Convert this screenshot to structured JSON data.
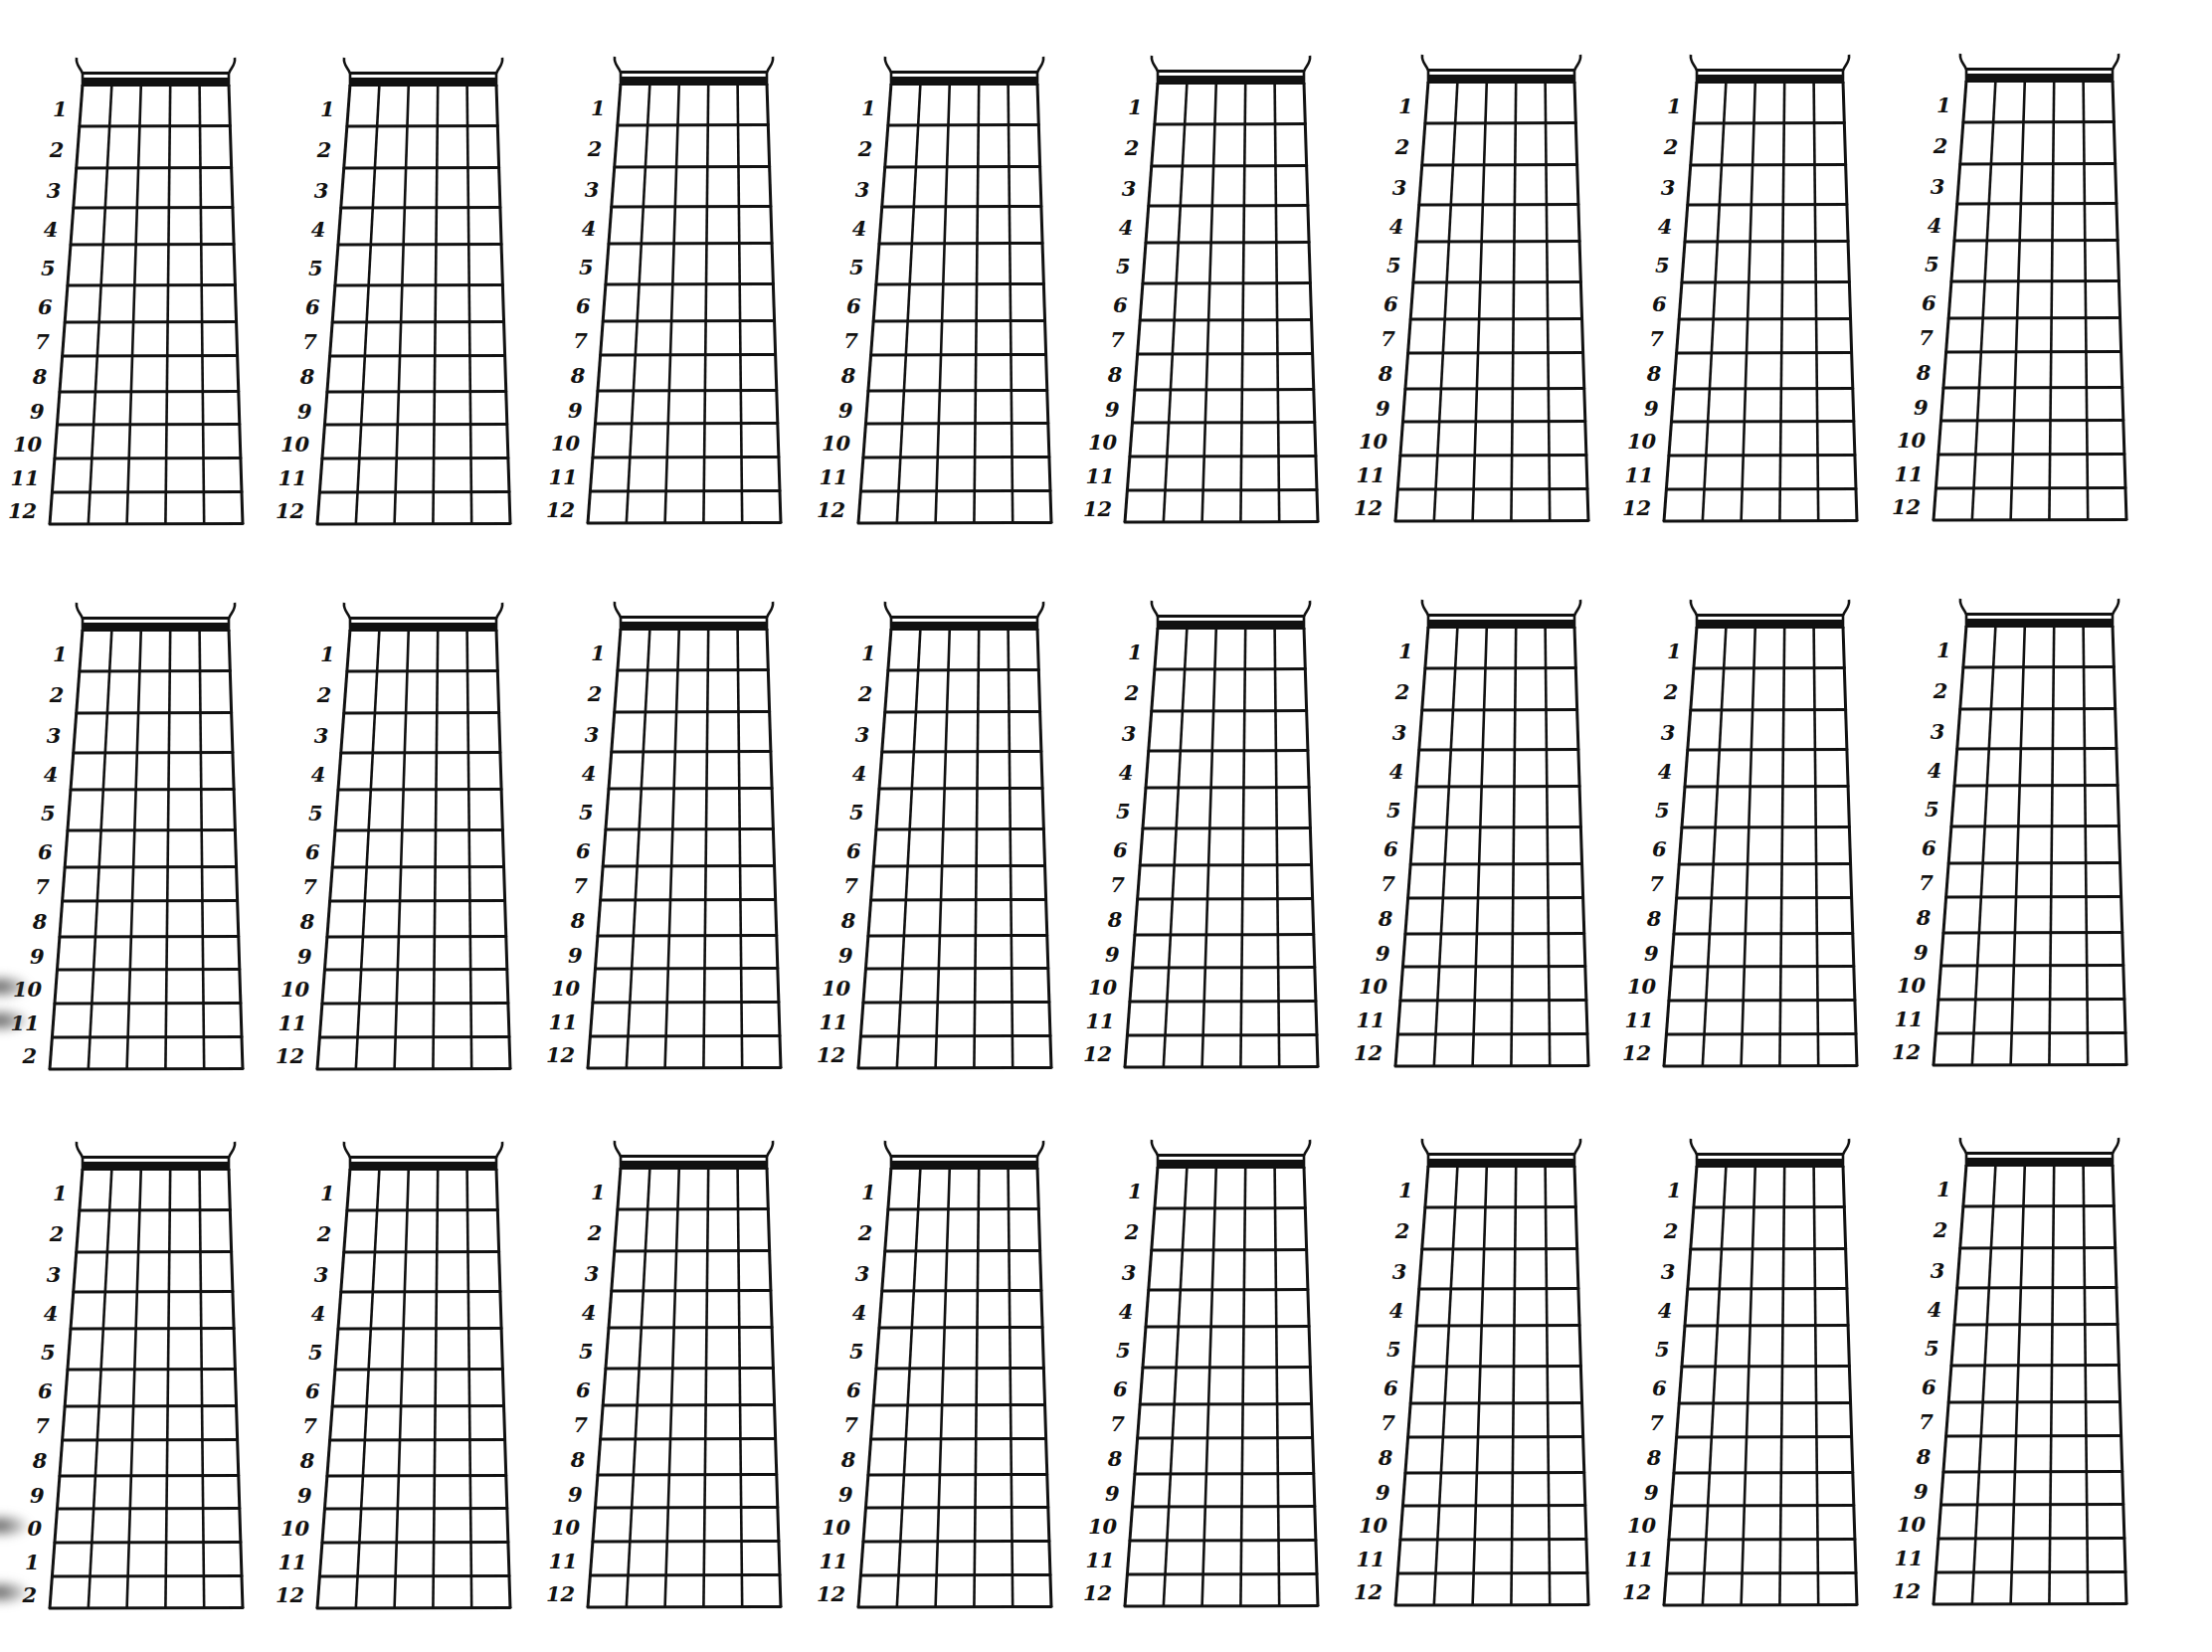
{
  "sheet": {
    "title": "Blank fretboard diagrams",
    "rows": 3,
    "columns": 8,
    "frets_per_diagram": 12,
    "strings_per_diagram": 6,
    "line_color": "#111111",
    "background": "#ffffff"
  },
  "fret_labels_default": [
    "1",
    "2",
    "3",
    "4",
    "5",
    "6",
    "7",
    "8",
    "9",
    "10",
    "11",
    "12"
  ],
  "diagram_rows": [
    {
      "row": 1,
      "diagrams": [
        {
          "col": 1,
          "labels": [
            "1",
            "2",
            "3",
            "4",
            "5",
            "6",
            "7",
            "8",
            "9",
            "10",
            "11",
            "12"
          ]
        },
        {
          "col": 2,
          "labels": [
            "1",
            "2",
            "3",
            "4",
            "5",
            "6",
            "7",
            "8",
            "9",
            "10",
            "11",
            "12"
          ]
        },
        {
          "col": 3,
          "labels": [
            "1",
            "2",
            "3",
            "4",
            "5",
            "6",
            "7",
            "8",
            "9",
            "10",
            "11",
            "12"
          ]
        },
        {
          "col": 4,
          "labels": [
            "1",
            "2",
            "3",
            "4",
            "5",
            "6",
            "7",
            "8",
            "9",
            "10",
            "11",
            "12"
          ]
        },
        {
          "col": 5,
          "labels": [
            "1",
            "2",
            "3",
            "4",
            "5",
            "6",
            "7",
            "8",
            "9",
            "10",
            "11",
            "12"
          ]
        },
        {
          "col": 6,
          "labels": [
            "1",
            "2",
            "3",
            "4",
            "5",
            "6",
            "7",
            "8",
            "9",
            "10",
            "11",
            "12"
          ]
        },
        {
          "col": 7,
          "labels": [
            "1",
            "2",
            "3",
            "4",
            "5",
            "6",
            "7",
            "8",
            "9",
            "10",
            "11",
            "12"
          ]
        },
        {
          "col": 8,
          "labels": [
            "1",
            "2",
            "3",
            "4",
            "5",
            "6",
            "7",
            "8",
            "9",
            "10",
            "11",
            "12"
          ]
        }
      ]
    },
    {
      "row": 2,
      "diagrams": [
        {
          "col": 1,
          "labels": [
            "1",
            "2",
            "3",
            "4",
            "5",
            "6",
            "7",
            "8",
            "9",
            "10",
            "11",
            "2"
          ]
        },
        {
          "col": 2,
          "labels": [
            "1",
            "2",
            "3",
            "4",
            "5",
            "6",
            "7",
            "8",
            "9",
            "10",
            "11",
            "12"
          ]
        },
        {
          "col": 3,
          "labels": [
            "1",
            "2",
            "3",
            "4",
            "5",
            "6",
            "7",
            "8",
            "9",
            "10",
            "11",
            "12"
          ]
        },
        {
          "col": 4,
          "labels": [
            "1",
            "2",
            "3",
            "4",
            "5",
            "6",
            "7",
            "8",
            "9",
            "10",
            "11",
            "12"
          ]
        },
        {
          "col": 5,
          "labels": [
            "1",
            "2",
            "3",
            "4",
            "5",
            "6",
            "7",
            "8",
            "9",
            "10",
            "11",
            "12"
          ]
        },
        {
          "col": 6,
          "labels": [
            "1",
            "2",
            "3",
            "4",
            "5",
            "6",
            "7",
            "8",
            "9",
            "10",
            "11",
            "12"
          ]
        },
        {
          "col": 7,
          "labels": [
            "1",
            "2",
            "3",
            "4",
            "5",
            "6",
            "7",
            "8",
            "9",
            "10",
            "11",
            "12"
          ]
        },
        {
          "col": 8,
          "labels": [
            "1",
            "2",
            "3",
            "4",
            "5",
            "6",
            "7",
            "8",
            "9",
            "10",
            "11",
            "12"
          ]
        }
      ]
    },
    {
      "row": 3,
      "diagrams": [
        {
          "col": 1,
          "labels": [
            "1",
            "2",
            "3",
            "4",
            "5",
            "6",
            "7",
            "8",
            "9",
            "0",
            "1",
            "2"
          ]
        },
        {
          "col": 2,
          "labels": [
            "1",
            "2",
            "3",
            "4",
            "5",
            "6",
            "7",
            "8",
            "9",
            "10",
            "11",
            "12"
          ]
        },
        {
          "col": 3,
          "labels": [
            "1",
            "2",
            "3",
            "4",
            "5",
            "6",
            "7",
            "8",
            "9",
            "10",
            "11",
            "12"
          ]
        },
        {
          "col": 4,
          "labels": [
            "1",
            "2",
            "3",
            "4",
            "5",
            "6",
            "7",
            "8",
            "9",
            "10",
            "11",
            "12"
          ]
        },
        {
          "col": 5,
          "labels": [
            "1",
            "2",
            "3",
            "4",
            "5",
            "6",
            "7",
            "8",
            "9",
            "10",
            "11",
            "12"
          ]
        },
        {
          "col": 6,
          "labels": [
            "1",
            "2",
            "3",
            "4",
            "5",
            "6",
            "7",
            "8",
            "9",
            "10",
            "11",
            "12"
          ]
        },
        {
          "col": 7,
          "labels": [
            "1",
            "2",
            "3",
            "4",
            "5",
            "6",
            "7",
            "8",
            "9",
            "10",
            "11",
            "12"
          ]
        },
        {
          "col": 8,
          "labels": [
            "1",
            "2",
            "3",
            "4",
            "5",
            "6",
            "7",
            "8",
            "9",
            "10",
            "11",
            "12"
          ]
        }
      ]
    }
  ],
  "layout": {
    "row_tops": [
      72,
      620,
      1162
    ],
    "col_lefts": [
      83,
      352,
      624,
      896,
      1164,
      1436,
      1706,
      1977
    ],
    "col_top_shift": [
      0,
      0,
      -1,
      -1,
      -2,
      -3,
      -3,
      -4
    ],
    "nut_width": 147,
    "bottom_extend_left": 33,
    "bottom_extend_right": 14,
    "nut_height": 13,
    "fret_heights": [
      40,
      42,
      40,
      37,
      41,
      37,
      34,
      36,
      33,
      34,
      34,
      32
    ],
    "edge_smudges": [
      {
        "row": 2,
        "fret": 10
      },
      {
        "row": 2,
        "fret": 11
      },
      {
        "row": 3,
        "fret": 10
      },
      {
        "row": 3,
        "fret": 12
      }
    ]
  }
}
